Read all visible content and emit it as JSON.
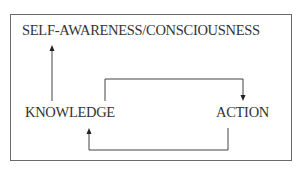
{
  "diagram": {
    "nodes": [
      {
        "id": "top",
        "label": "SELF-AWARENESS/CONSCIOUSNESS"
      },
      {
        "id": "knowledge",
        "label": "KNOWLEDGE"
      },
      {
        "id": "action",
        "label": "ACTION"
      }
    ],
    "edges": [
      {
        "from": "knowledge",
        "to": "top"
      },
      {
        "from": "knowledge",
        "to": "action"
      },
      {
        "from": "action",
        "to": "knowledge"
      }
    ]
  }
}
